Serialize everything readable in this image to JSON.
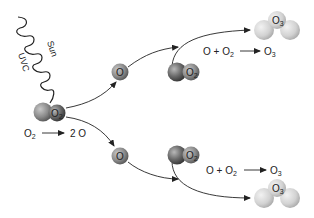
{
  "diagram": {
    "source": {
      "sun_label": "Sun",
      "radiation_label": "UVC"
    },
    "photolysis": {
      "reactant": "O",
      "reactant_sub": "2",
      "arrow": "→",
      "product": "2 O"
    },
    "molecules": {
      "o2_label": "O",
      "o2_sub": "2",
      "o_label": "O",
      "o3_label": "O",
      "o3_sub": "3"
    },
    "reactions": [
      {
        "lhs1": "O",
        "plus": "+",
        "lhs2": "O",
        "lhs2_sub": "2",
        "rhs": "O",
        "rhs_sub": "3"
      },
      {
        "lhs1": "O",
        "plus": "+",
        "lhs2": "O",
        "lhs2_sub": "2",
        "rhs": "O",
        "rhs_sub": "3"
      }
    ],
    "colors": {
      "dark_atom": "#5a5a5a",
      "light_atom": "#d4d4d4",
      "line": "#222222"
    }
  }
}
